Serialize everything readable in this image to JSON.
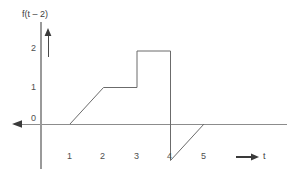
{
  "chart_data": {
    "type": "line",
    "title": "f(t – 2)",
    "xlabel": "t",
    "ylabel": "f(t – 2)",
    "xlim": [
      -1,
      7.5
    ],
    "ylim": [
      -1.2,
      2.6
    ],
    "grid": false,
    "legend": null,
    "x_ticks": [
      "1",
      "2",
      "3",
      "4",
      "5"
    ],
    "x_tick_values": [
      1,
      2,
      3,
      4,
      5
    ],
    "y_ticks": [
      "0",
      "1",
      "2"
    ],
    "y_tick_values": [
      0,
      1,
      2
    ],
    "x_axis_arrow_direction": "left",
    "y_axis_arrow_direction": "up",
    "series": [
      {
        "name": "f(t – 2)",
        "points": [
          [
            1,
            0
          ],
          [
            2,
            1
          ],
          [
            3,
            1
          ],
          [
            3,
            2
          ],
          [
            4,
            2
          ],
          [
            4,
            -1
          ],
          [
            5,
            0
          ]
        ]
      }
    ],
    "annotations": {
      "x_axis_end_label": "t",
      "x_axis_end_arrow": "→"
    }
  },
  "labels": {
    "title": "f(t – 2)",
    "y2": "2",
    "y1": "1",
    "y0": "0",
    "x1": "1",
    "x2": "2",
    "x3": "3",
    "x4": "4",
    "x5": "5",
    "t": "t"
  },
  "colors": {
    "axis": "#8c8c8c",
    "curve": "#6b6b6b",
    "text": "#4a4a4a",
    "background": "#ffffff"
  }
}
